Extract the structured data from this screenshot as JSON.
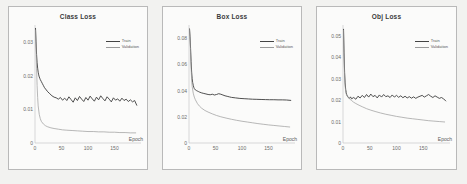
{
  "figure": {
    "background": "#f2f2f0",
    "panel_background": "#fbfbfa",
    "panel_border": "#b9b9b9",
    "train_color": "#3c3c3c",
    "validation_color": "#9a9a9a"
  },
  "chart_data": [
    {
      "type": "line",
      "title": "Class Loss",
      "xlabel": "Epoch",
      "ylabel": "",
      "xlim": [
        0,
        200
      ],
      "ylim": [
        0,
        0.035
      ],
      "xticks": [
        0,
        50,
        100,
        150
      ],
      "xtick_labels": [
        "0",
        "50",
        "100",
        "150"
      ],
      "yticks": [
        0,
        0.01,
        0.02,
        0.03
      ],
      "ytick_labels": [
        "0",
        "0.01",
        "0.02",
        "0.03"
      ],
      "grid": false,
      "legend_position": "upper right",
      "series": [
        {
          "name": "Train",
          "x": [
            1,
            2,
            3,
            4,
            5,
            6,
            7,
            8,
            9,
            10,
            12,
            14,
            16,
            18,
            20,
            24,
            28,
            32,
            36,
            40,
            44,
            48,
            52,
            56,
            60,
            64,
            68,
            72,
            76,
            80,
            84,
            88,
            92,
            96,
            100,
            104,
            108,
            112,
            116,
            120,
            124,
            128,
            132,
            136,
            140,
            144,
            148,
            152,
            156,
            160,
            164,
            168,
            172,
            176,
            180,
            184,
            188,
            192
          ],
          "y": [
            0.034,
            0.03,
            0.0262,
            0.0238,
            0.0222,
            0.021,
            0.0202,
            0.0196,
            0.0192,
            0.0188,
            0.0182,
            0.0176,
            0.017,
            0.0164,
            0.016,
            0.0152,
            0.0146,
            0.014,
            0.0136,
            0.0134,
            0.013,
            0.0135,
            0.0127,
            0.0133,
            0.0126,
            0.0137,
            0.0129,
            0.0121,
            0.0134,
            0.0126,
            0.0138,
            0.013,
            0.0123,
            0.0135,
            0.0127,
            0.0139,
            0.0131,
            0.0124,
            0.0136,
            0.0128,
            0.014,
            0.0132,
            0.0125,
            0.0137,
            0.013,
            0.0122,
            0.0134,
            0.0127,
            0.0131,
            0.0124,
            0.0133,
            0.0126,
            0.013,
            0.0123,
            0.0128,
            0.0122,
            0.0126,
            0.0112
          ]
        },
        {
          "name": "Validation",
          "x": [
            1,
            2,
            3,
            4,
            5,
            6,
            8,
            10,
            12,
            16,
            20,
            24,
            30,
            36,
            44,
            52,
            60,
            70,
            80,
            90,
            100,
            110,
            120,
            130,
            140,
            150,
            160,
            170,
            180,
            190
          ],
          "y": [
            0.0335,
            0.028,
            0.022,
            0.017,
            0.0135,
            0.011,
            0.0085,
            0.0072,
            0.0064,
            0.0056,
            0.0051,
            0.0048,
            0.0045,
            0.0043,
            0.0041,
            0.0039,
            0.0038,
            0.0037,
            0.0036,
            0.0035,
            0.0034,
            0.0034,
            0.0033,
            0.0033,
            0.0032,
            0.0032,
            0.0031,
            0.0031,
            0.003,
            0.003
          ]
        }
      ]
    },
    {
      "type": "line",
      "title": "Box Loss",
      "xlabel": "Epoch",
      "ylabel": "",
      "xlim": [
        0,
        200
      ],
      "ylim": [
        0,
        0.09
      ],
      "xticks": [
        0,
        50,
        100,
        150
      ],
      "xtick_labels": [
        "0",
        "50",
        "100",
        "150"
      ],
      "yticks": [
        0,
        0.02,
        0.04,
        0.06,
        0.08
      ],
      "ytick_labels": [
        "0",
        "0.02",
        "0.04",
        "0.06",
        "0.08"
      ],
      "grid": false,
      "legend_position": "upper right",
      "series": [
        {
          "name": "Train",
          "x": [
            1,
            2,
            3,
            4,
            5,
            6,
            7,
            8,
            9,
            10,
            12,
            14,
            16,
            18,
            20,
            24,
            28,
            32,
            36,
            40,
            44,
            48,
            52,
            56,
            60,
            64,
            68,
            72,
            76,
            80,
            88,
            96,
            104,
            112,
            120,
            128,
            136,
            144,
            152,
            160,
            168,
            176,
            184,
            192
          ],
          "y": [
            0.087,
            0.081,
            0.072,
            0.062,
            0.054,
            0.049,
            0.046,
            0.044,
            0.0425,
            0.0415,
            0.0405,
            0.04,
            0.0396,
            0.0392,
            0.0388,
            0.0382,
            0.0378,
            0.0374,
            0.037,
            0.0368,
            0.0372,
            0.0366,
            0.037,
            0.0376,
            0.0372,
            0.0366,
            0.036,
            0.0356,
            0.0352,
            0.0348,
            0.0344,
            0.034,
            0.0338,
            0.0336,
            0.0334,
            0.0333,
            0.0332,
            0.0331,
            0.033,
            0.033,
            0.0329,
            0.0329,
            0.0328,
            0.0325
          ]
        },
        {
          "name": "Validation",
          "x": [
            1,
            2,
            3,
            4,
            5,
            6,
            8,
            10,
            12,
            16,
            20,
            24,
            30,
            36,
            44,
            52,
            60,
            70,
            80,
            90,
            100,
            110,
            120,
            130,
            140,
            150,
            160,
            170,
            180,
            190
          ],
          "y": [
            0.0865,
            0.079,
            0.068,
            0.057,
            0.048,
            0.043,
            0.038,
            0.035,
            0.033,
            0.03,
            0.028,
            0.0265,
            0.0248,
            0.0236,
            0.0222,
            0.021,
            0.02,
            0.019,
            0.0181,
            0.0173,
            0.0166,
            0.016,
            0.0154,
            0.0148,
            0.0143,
            0.0138,
            0.0134,
            0.013,
            0.0126,
            0.0122
          ]
        }
      ]
    },
    {
      "type": "line",
      "title": "Obj Loss",
      "xlabel": "Epoch",
      "ylabel": "",
      "xlim": [
        0,
        200
      ],
      "ylim": [
        0,
        0.055
      ],
      "xticks": [
        0,
        50,
        100,
        150
      ],
      "xtick_labels": [
        "0",
        "50",
        "100",
        "150"
      ],
      "yticks": [
        0,
        0.01,
        0.02,
        0.03,
        0.04,
        0.05
      ],
      "ytick_labels": [
        "0",
        "0.01",
        "0.02",
        "0.03",
        "0.04",
        "0.05"
      ],
      "grid": false,
      "legend_position": "upper right",
      "series": [
        {
          "name": "Train",
          "x": [
            1,
            2,
            3,
            4,
            5,
            6,
            7,
            8,
            10,
            12,
            14,
            16,
            20,
            24,
            28,
            32,
            36,
            40,
            44,
            48,
            52,
            56,
            60,
            64,
            68,
            72,
            76,
            80,
            84,
            88,
            92,
            96,
            100,
            104,
            108,
            112,
            116,
            120,
            124,
            128,
            132,
            136,
            140,
            144,
            148,
            152,
            156,
            160,
            164,
            168,
            172,
            176,
            180,
            184,
            188,
            192
          ],
          "y": [
            0.053,
            0.042,
            0.033,
            0.028,
            0.025,
            0.0235,
            0.0225,
            0.022,
            0.0212,
            0.0208,
            0.0215,
            0.0206,
            0.0212,
            0.0204,
            0.0218,
            0.021,
            0.0222,
            0.0212,
            0.0226,
            0.0214,
            0.0228,
            0.0216,
            0.0222,
            0.021,
            0.0224,
            0.0214,
            0.0226,
            0.0216,
            0.022,
            0.0212,
            0.0224,
            0.0214,
            0.0222,
            0.0213,
            0.022,
            0.0211,
            0.0218,
            0.021,
            0.0216,
            0.0209,
            0.0215,
            0.0208,
            0.0214,
            0.0218,
            0.0222,
            0.0214,
            0.022,
            0.0226,
            0.0218,
            0.0212,
            0.022,
            0.0214,
            0.0208,
            0.0212,
            0.0206,
            0.0196
          ]
        },
        {
          "name": "Validation",
          "x": [
            1,
            2,
            3,
            4,
            5,
            6,
            8,
            10,
            12,
            16,
            20,
            24,
            30,
            36,
            44,
            52,
            60,
            70,
            80,
            90,
            100,
            110,
            120,
            130,
            140,
            150,
            160,
            170,
            180,
            190
          ],
          "y": [
            0.0525,
            0.04,
            0.031,
            0.0265,
            0.024,
            0.0228,
            0.0218,
            0.0212,
            0.0206,
            0.0198,
            0.019,
            0.0184,
            0.0176,
            0.0169,
            0.016,
            0.0153,
            0.0147,
            0.014,
            0.0134,
            0.0129,
            0.0124,
            0.012,
            0.0116,
            0.0113,
            0.011,
            0.0107,
            0.0104,
            0.0102,
            0.01,
            0.0098
          ]
        }
      ]
    }
  ]
}
